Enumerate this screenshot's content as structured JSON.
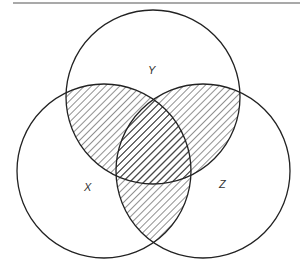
{
  "diagram": {
    "type": "venn",
    "sets": [
      {
        "id": "X",
        "label": "X",
        "cx": 104,
        "cy": 171,
        "r": 87,
        "label_x": 88,
        "label_y": 191
      },
      {
        "id": "Y",
        "label": "Y",
        "cx": 153,
        "cy": 97,
        "r": 87,
        "label_x": 152,
        "label_y": 74
      },
      {
        "id": "Z",
        "label": "Z",
        "cx": 203,
        "cy": 171,
        "r": 87,
        "label_x": 222,
        "label_y": 188
      }
    ],
    "shaded_regions": [
      "X∩Y",
      "Y∩Z",
      "X∩Z"
    ],
    "shading": "diagonal hatching",
    "colors": {
      "stroke": "#222222",
      "hatch": "#333333",
      "background": "#ffffff",
      "rule": "#555555"
    }
  }
}
